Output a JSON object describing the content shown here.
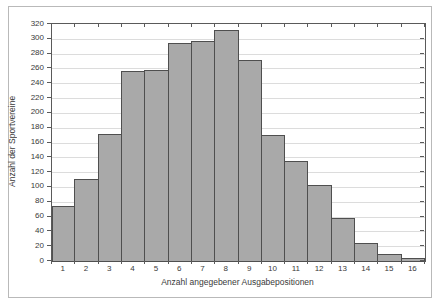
{
  "chart_data": {
    "type": "bar",
    "title": "",
    "categories": [
      "1",
      "2",
      "3",
      "4",
      "5",
      "6",
      "7",
      "8",
      "9",
      "10",
      "11",
      "12",
      "13",
      "14",
      "15",
      "16"
    ],
    "values": [
      74,
      111,
      172,
      256,
      258,
      295,
      297,
      312,
      272,
      170,
      135,
      103,
      58,
      24,
      9,
      4
    ],
    "xlabel": "Anzahl angegebener Ausgabepositionen",
    "ylabel": "Anzahl der Sportvereine",
    "ylim": [
      0,
      320
    ],
    "yticks": [
      0,
      20,
      40,
      60,
      80,
      100,
      120,
      140,
      160,
      180,
      200,
      220,
      240,
      260,
      280,
      300,
      320
    ],
    "grid": "horizontal",
    "legend": "none",
    "colors": {
      "bar_fill": "#a9a9a9",
      "bar_border": "#4f4f4f",
      "gridline": "#dcdcdc",
      "axis": "#5a5a5a",
      "figure_border": "#b9b9b9",
      "background": "#ffffff"
    }
  }
}
